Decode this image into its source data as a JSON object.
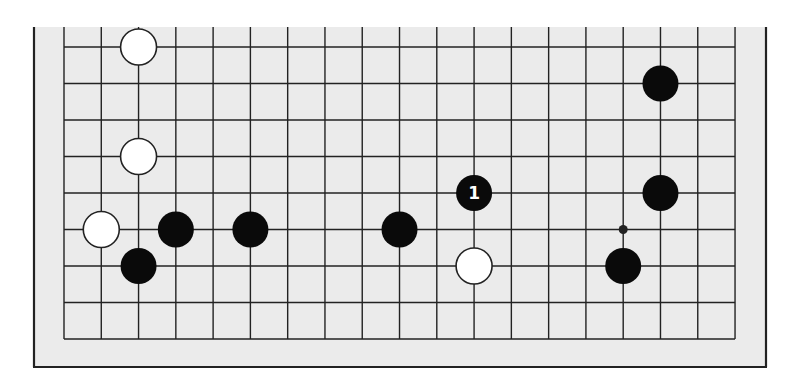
{
  "diagram": {
    "type": "go-board-partial",
    "background_color": "#ebebeb",
    "line_color": "#222222",
    "frame_color": "#222222",
    "grid": {
      "columns": 19,
      "rows": 9,
      "left_x": 64,
      "top_y": 47,
      "col_spacing": 37.28,
      "row_spacing": 36.5,
      "open_edge": "top"
    },
    "frame": {
      "left": 34,
      "right": 766,
      "top": 27,
      "bottom": 367
    },
    "stone_radius": 18,
    "star_points": [
      {
        "col": 15,
        "row": 5
      }
    ],
    "stones": [
      {
        "color": "white",
        "col": 2,
        "row": 0,
        "label": ""
      },
      {
        "color": "white",
        "col": 2,
        "row": 3,
        "label": ""
      },
      {
        "color": "white",
        "col": 1,
        "row": 5,
        "label": ""
      },
      {
        "color": "black",
        "col": 3,
        "row": 5,
        "label": ""
      },
      {
        "color": "black",
        "col": 2,
        "row": 6,
        "label": ""
      },
      {
        "color": "black",
        "col": 5,
        "row": 5,
        "label": ""
      },
      {
        "color": "black",
        "col": 9,
        "row": 5,
        "label": ""
      },
      {
        "color": "black",
        "col": 11,
        "row": 4,
        "label": "1"
      },
      {
        "color": "white",
        "col": 11,
        "row": 6,
        "label": ""
      },
      {
        "color": "black",
        "col": 16,
        "row": 1,
        "label": ""
      },
      {
        "color": "black",
        "col": 16,
        "row": 4,
        "label": ""
      },
      {
        "color": "black",
        "col": 15,
        "row": 6,
        "label": ""
      }
    ]
  }
}
